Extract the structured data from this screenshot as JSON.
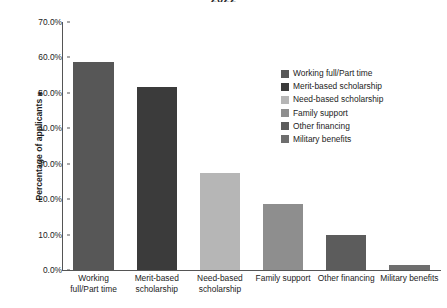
{
  "chart_data": {
    "type": "bar",
    "title": "2022",
    "xlabel": "",
    "ylabel": "Percentage of applicants ⁎",
    "ylim": [
      0,
      70
    ],
    "grid": false,
    "legend_position": "upper right",
    "categories": [
      "Working\nfull/Part time",
      "Merit-based\nscholarship",
      "Need-based\nscholarship",
      "Family support",
      "Other financing",
      "Military benefits"
    ],
    "legend_entries": [
      "Working full/Part time",
      "Merit-based scholarship",
      "Need-based scholarship",
      "Family support",
      "Other financing",
      "Military benefits"
    ],
    "values": [
      58.8,
      51.7,
      27.3,
      18.6,
      10.0,
      1.4
    ],
    "value_labels": [
      "58.8%",
      "51.7%",
      "27.3%",
      "18.6%",
      "10.0%",
      "1.4%"
    ],
    "colors": [
      "#575757",
      "#3b3b3b",
      "#b6b6b6",
      "#8e8e8e",
      "#5c5c5c",
      "#6e6e6e"
    ],
    "yticks": [
      {
        "value": 70,
        "label": "70.0%"
      },
      {
        "value": 60,
        "label": "60.0%"
      },
      {
        "value": 50,
        "label": "50.0%"
      },
      {
        "value": 40,
        "label": "40.0%"
      },
      {
        "value": 30,
        "label": "30.0%"
      },
      {
        "value": 20,
        "label": "20.0%"
      },
      {
        "value": 10,
        "label": "10.0%"
      },
      {
        "value": 0,
        "label": "0.0%"
      }
    ]
  },
  "axis": {
    "line_color": "#555555"
  }
}
